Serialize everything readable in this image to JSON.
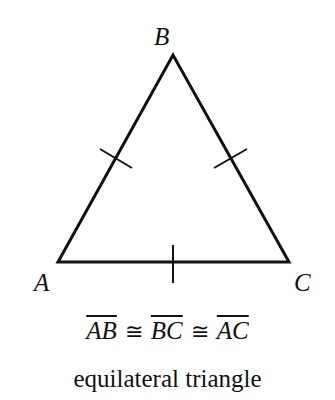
{
  "diagram": {
    "vertices": [
      {
        "name": "A",
        "x": 58,
        "y": 262
      },
      {
        "name": "B",
        "x": 173,
        "y": 55
      },
      {
        "name": "C",
        "x": 289,
        "y": 262
      }
    ],
    "labels": {
      "A": "A",
      "B": "B",
      "C": "C"
    },
    "sides": [
      "AB",
      "BC",
      "AC"
    ],
    "tick_marks": 1,
    "stroke_color": "#111111"
  },
  "equation": {
    "segments": [
      "AB",
      "BC",
      "AC"
    ],
    "congruence_symbol": "≅"
  },
  "caption": "equilateral triangle"
}
